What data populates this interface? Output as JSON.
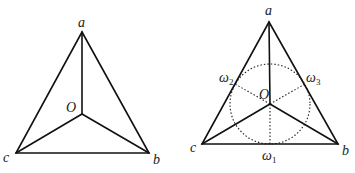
{
  "figure_left": {
    "vertices": {
      "a": {
        "x": 82,
        "y": 32,
        "label": "a"
      },
      "b": {
        "x": 149,
        "y": 153,
        "label": "b"
      },
      "c": {
        "x": 16,
        "y": 153,
        "label": "c"
      },
      "O": {
        "x": 82,
        "y": 114,
        "label": "O"
      }
    }
  },
  "figure_right": {
    "vertices": {
      "a": {
        "x": 269,
        "y": 22,
        "label": "a"
      },
      "b": {
        "x": 338,
        "y": 144,
        "label": "b"
      },
      "c": {
        "x": 202,
        "y": 144,
        "label": "c"
      },
      "O": {
        "x": 270,
        "y": 104,
        "label": "O"
      }
    },
    "circle": {
      "cx": 270,
      "cy": 104,
      "r": 40
    },
    "points": {
      "w1": {
        "x": 270,
        "y": 144,
        "label": "ω",
        "sub": "1"
      },
      "w2": {
        "x": 235,
        "y": 84,
        "label": "ω",
        "sub": "2"
      },
      "w3": {
        "x": 305,
        "y": 84,
        "label": "ω",
        "sub": "3"
      }
    }
  }
}
